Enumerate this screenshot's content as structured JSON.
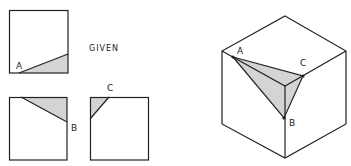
{
  "title": "GIVEN",
  "colors": {
    "stroke": "#222222",
    "shade": "#d4d4d4",
    "background": "#ffffff"
  },
  "views": [
    {
      "name": "front-view",
      "label": "A"
    },
    {
      "name": "top-view",
      "label": "B"
    },
    {
      "name": "side-view",
      "label": "C"
    }
  ],
  "isometric": {
    "labels": {
      "a": "A",
      "b": "B",
      "c": "C"
    }
  }
}
